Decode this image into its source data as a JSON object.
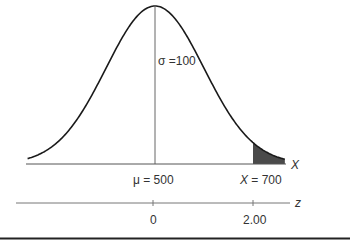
{
  "chart_data": {
    "type": "area",
    "title": "",
    "distribution": "normal",
    "mean": 500,
    "sd": 100,
    "shaded_region": {
      "from_x": 700,
      "to_x": "right tail",
      "from_z": 2.0
    },
    "x_axis": {
      "label": "X",
      "ticks": [
        {
          "value": 500,
          "label": "μ = 500"
        },
        {
          "value": 700,
          "label": "X = 700"
        }
      ]
    },
    "z_axis": {
      "label": "z",
      "ticks": [
        {
          "value": 0,
          "label": "0"
        },
        {
          "value": 2.0,
          "label": "2.00"
        }
      ]
    },
    "annotations": [
      "σ =100"
    ],
    "grid": false
  },
  "labels": {
    "sigma": "σ =100",
    "mu": "μ = 500",
    "x_value_prefix": "X",
    "x_value_suffix": " = 700",
    "x_axis": "X",
    "z_axis": "z",
    "z_zero": "0",
    "z_two": "2.00"
  },
  "colors": {
    "curve": "#1a1a1a",
    "axis": "#555555",
    "shade": "#4a4a4a",
    "rule": "#222222"
  }
}
